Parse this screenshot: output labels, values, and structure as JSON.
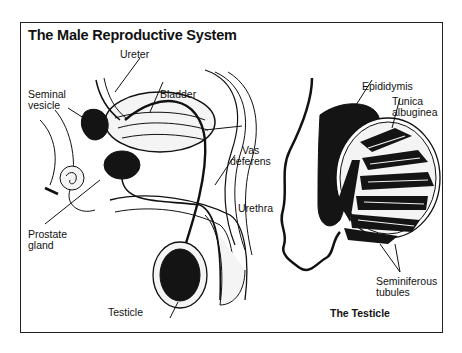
{
  "diagram": {
    "title": "The Male Reproductive System",
    "labels": {
      "ureter": "Ureter",
      "seminal_vesicle_1": "Seminal",
      "seminal_vesicle_2": "vesicle",
      "bladder": "Bladder",
      "vas_deferens_1": "Vas",
      "vas_deferens_2": "deferens",
      "urethra": "Urethra",
      "prostate_1": "Prostate",
      "prostate_2": "gland",
      "testicle": "Testicle",
      "epididymis": "Epididymis",
      "tunica_1": "Tunica",
      "tunica_2": "albuginea",
      "seminiferous_1": "Seminiferous",
      "seminiferous_2": "tubules"
    },
    "inset_caption": "The Testicle",
    "colors": {
      "ink": "#111111",
      "fill_dark": "#141414",
      "tissue": "#f4f4f4",
      "frame": "#222222"
    }
  }
}
